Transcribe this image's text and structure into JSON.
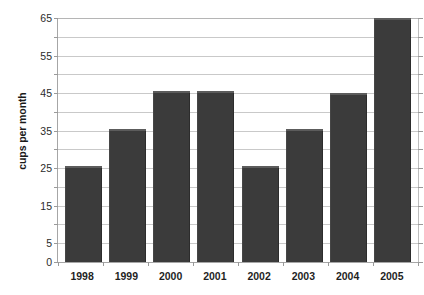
{
  "chart_data": {
    "type": "bar",
    "title": "",
    "subtitle": "",
    "xlabel": "",
    "ylabel": "cups per month",
    "categories": [
      "1998",
      "1999",
      "2000",
      "2001",
      "2002",
      "2003",
      "2004",
      "2005"
    ],
    "values": [
      25,
      35,
      45,
      45,
      25,
      35,
      44.5,
      64.5
    ],
    "series": [
      {
        "name": "cups per month",
        "values": [
          25,
          35,
          45,
          45,
          25,
          35,
          44.5,
          64.5
        ],
        "color": "#3b3b3b"
      }
    ],
    "ylim": [
      0,
      65
    ],
    "y_tick_labels": [
      "0",
      "5",
      "15",
      "25",
      "35",
      "45",
      "55",
      "65"
    ],
    "y_tick_values": [
      0,
      5,
      15,
      25,
      35,
      45,
      55,
      65
    ],
    "y_gridline_values": [
      5,
      10,
      15,
      20,
      25,
      30,
      35,
      40,
      45,
      50,
      55,
      60,
      65
    ],
    "y_minor_tick_values": [
      10,
      20,
      30,
      40,
      50,
      60
    ],
    "grid": true,
    "grid_axis": "y",
    "legend": false,
    "legend_position": "none",
    "annotations": [],
    "colors": {
      "bar": "#3b3b3b",
      "bar_highlight": "#5c5c5c",
      "gridline": "#c9c9c9",
      "axis": "#a6a6a6",
      "background": "#ffffff",
      "text": "#1f1f1f"
    }
  }
}
